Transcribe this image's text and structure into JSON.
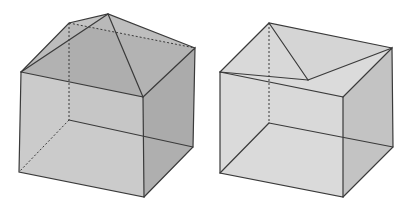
{
  "figure": {
    "description": "Two translucent grey cubes shown in oblique perspective",
    "colors": {
      "background": "#ffffff",
      "edge": "#3a3a3a",
      "left_cube_front_face": "#c6c6c6",
      "left_cube_side_face": "#a4a4a4",
      "left_cube_top_faces": "#b2b2b2",
      "left_cube_back_faces": "#9a9a9a",
      "right_cube_front_face": "#d6d6d6",
      "right_cube_side_face": "#bdbdbd",
      "right_cube_top_faces": "#d0d0d0",
      "right_cube_back_faces": "#c4c4c4"
    },
    "shapes": [
      {
        "id": "left-cube",
        "label": "Cube with pyramid-like top (apex raised above top face)",
        "vertices": {
          "front_top_left": [
            21,
            72
          ],
          "front_top_right": [
            143,
            97
          ],
          "back_top_right": [
            195,
            48
          ],
          "back_top_left": [
            69,
            23
          ],
          "apex": [
            108,
            14
          ],
          "front_bottom_left": [
            19,
            172
          ],
          "front_bottom_right": [
            144,
            197
          ],
          "back_bottom_right": [
            193,
            147
          ],
          "back_bottom_left": [
            69,
            120
          ]
        }
      },
      {
        "id": "right-cube",
        "label": "Cube with folded/indented top (inner point below top plane)",
        "vertices": {
          "front_top_left": [
            220,
            72
          ],
          "front_top_right": [
            343,
            97
          ],
          "back_top_right": [
            392,
            48
          ],
          "back_top_left": [
            269,
            23
          ],
          "inner_point": [
            308,
            80
          ],
          "front_bottom_left": [
            220,
            173
          ],
          "front_bottom_right": [
            343,
            197
          ],
          "back_bottom_right": [
            393,
            147
          ],
          "back_bottom_left": [
            269,
            123
          ]
        }
      }
    ]
  }
}
